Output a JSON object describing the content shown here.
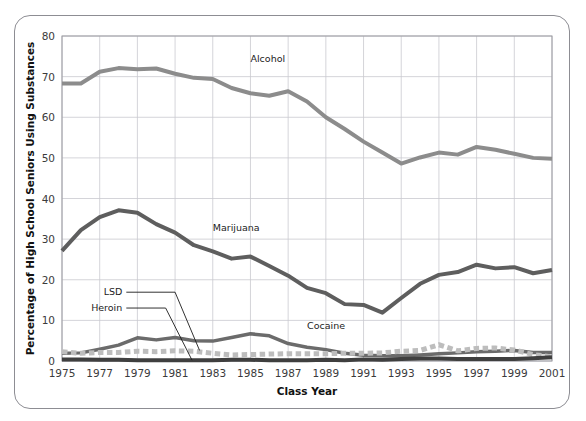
{
  "figure": {
    "frame_color": "#8d8d93",
    "background": "#ffffff"
  },
  "chart_data": {
    "type": "line",
    "title": "",
    "xlabel": "Class Year",
    "ylabel": "Percentage of High School Seniors Using Substances",
    "xlim": [
      1975,
      2001
    ],
    "ylim": [
      0,
      80
    ],
    "ytick_step": 10,
    "yticks": [
      "0",
      "10",
      "20",
      "30",
      "40",
      "50",
      "60",
      "70",
      "80"
    ],
    "xticks": [
      "1975",
      "1977",
      "1979",
      "1981",
      "1983",
      "1985",
      "1987",
      "1989",
      "1991",
      "1993",
      "1995",
      "1997",
      "1999",
      "2001"
    ],
    "grid": true,
    "legend": "inline-labels",
    "x": [
      1975,
      1976,
      1977,
      1978,
      1979,
      1980,
      1981,
      1982,
      1983,
      1984,
      1985,
      1986,
      1987,
      1988,
      1989,
      1990,
      1991,
      1992,
      1993,
      1994,
      1995,
      1996,
      1997,
      1998,
      1999,
      2000,
      2001
    ],
    "series": [
      {
        "name": "Alcohol",
        "color": "#8c8c8c",
        "style": "solid",
        "width": 4,
        "label_x": 1985,
        "label_y": 73.5,
        "values": [
          68.3,
          68.3,
          71.2,
          72.1,
          71.8,
          72.0,
          70.7,
          69.7,
          69.4,
          67.2,
          65.9,
          65.3,
          66.4,
          63.9,
          60.0,
          57.1,
          54.0,
          51.3,
          48.6,
          50.1,
          51.3,
          50.8,
          52.7,
          52.0,
          51.0,
          50.0,
          49.8
        ]
      },
      {
        "name": "Marijuana",
        "color": "#5e5e5e",
        "style": "solid",
        "width": 4,
        "label_x": 1983,
        "label_y": 32.0,
        "values": [
          27.1,
          32.2,
          35.4,
          37.1,
          36.5,
          33.7,
          31.6,
          28.5,
          27.0,
          25.2,
          25.7,
          23.4,
          21.0,
          18.0,
          16.7,
          14.0,
          13.8,
          11.9,
          15.5,
          19.0,
          21.2,
          21.9,
          23.7,
          22.8,
          23.1,
          21.6,
          22.4
        ]
      },
      {
        "name": "Cocaine",
        "color": "#6b6b6b",
        "style": "solid",
        "width": 3.5,
        "label_x": 1988,
        "label_y": 8.0,
        "values": [
          1.9,
          2.0,
          2.9,
          3.9,
          5.7,
          5.2,
          5.8,
          5.0,
          4.9,
          5.8,
          6.7,
          6.2,
          4.3,
          3.4,
          2.8,
          1.9,
          1.4,
          1.3,
          1.3,
          1.5,
          1.8,
          2.0,
          2.3,
          2.4,
          2.6,
          2.1,
          2.1
        ]
      },
      {
        "name": "LSD",
        "color": "#bdbdbd",
        "style": "dotted",
        "width": 5,
        "label_x": 1978.2,
        "label_y": 16.2,
        "values": [
          2.3,
          1.9,
          2.1,
          2.1,
          2.4,
          2.3,
          2.5,
          2.4,
          1.9,
          1.5,
          1.6,
          1.7,
          1.8,
          1.8,
          1.8,
          1.9,
          1.9,
          2.0,
          2.4,
          2.6,
          4.0,
          2.5,
          3.1,
          3.2,
          2.7,
          1.6,
          1.0
        ]
      },
      {
        "name": "Heroin",
        "color": "#3f3f3f",
        "style": "solid",
        "width": 4,
        "label_x": 1978.2,
        "label_y": 12.3,
        "values": [
          0.4,
          0.4,
          0.3,
          0.3,
          0.2,
          0.2,
          0.2,
          0.2,
          0.2,
          0.3,
          0.3,
          0.2,
          0.2,
          0.2,
          0.3,
          0.2,
          0.4,
          0.3,
          0.5,
          0.6,
          0.6,
          0.5,
          0.5,
          0.5,
          0.5,
          0.7,
          0.9
        ]
      }
    ]
  }
}
